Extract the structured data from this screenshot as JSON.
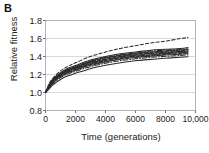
{
  "panel": {
    "label": "B"
  },
  "chart_data": {
    "type": "line",
    "title": "",
    "xlabel": "Time (generations)",
    "ylabel": "Relative fitness",
    "xlim": [
      0,
      10000
    ],
    "ylim": [
      0.8,
      1.8
    ],
    "grid": true,
    "grid_axis": "y",
    "legend": "none",
    "xticks": [
      0,
      2000,
      4000,
      6000,
      8000,
      10000
    ],
    "xtick_labels": [
      "0",
      "2000",
      "4000",
      "6000",
      "8000",
      "10,000"
    ],
    "yticks": [
      0.8,
      1.0,
      1.2,
      1.4,
      1.6,
      1.8
    ],
    "ytick_labels": [
      "0.8",
      "1.0",
      "1.2",
      "1.4",
      "1.6",
      "1.8"
    ],
    "x": [
      0,
      250,
      500,
      1000,
      1500,
      2000,
      3000,
      4000,
      5000,
      6000,
      7000,
      8000,
      9000,
      9500
    ],
    "series": [
      {
        "name": "population-1",
        "style": "dashed",
        "values": [
          1.0,
          1.1,
          1.16,
          1.24,
          1.29,
          1.33,
          1.4,
          1.45,
          1.49,
          1.52,
          1.55,
          1.57,
          1.6,
          1.61
        ]
      },
      {
        "name": "population-2",
        "style": "solid",
        "values": [
          1.0,
          1.09,
          1.15,
          1.22,
          1.27,
          1.3,
          1.36,
          1.4,
          1.43,
          1.45,
          1.47,
          1.48,
          1.49,
          1.5
        ]
      },
      {
        "name": "population-3",
        "style": "dashdot",
        "values": [
          1.0,
          1.08,
          1.14,
          1.21,
          1.26,
          1.29,
          1.35,
          1.39,
          1.42,
          1.44,
          1.46,
          1.47,
          1.48,
          1.485
        ]
      },
      {
        "name": "population-4",
        "style": "solid",
        "values": [
          1.0,
          1.08,
          1.14,
          1.21,
          1.255,
          1.285,
          1.345,
          1.385,
          1.415,
          1.435,
          1.45,
          1.462,
          1.472,
          1.477
        ]
      },
      {
        "name": "population-5",
        "style": "dashed",
        "values": [
          1.0,
          1.075,
          1.135,
          1.205,
          1.25,
          1.28,
          1.34,
          1.378,
          1.408,
          1.428,
          1.443,
          1.455,
          1.465,
          1.47
        ]
      },
      {
        "name": "population-6",
        "style": "solid",
        "values": [
          1.0,
          1.07,
          1.13,
          1.2,
          1.245,
          1.275,
          1.332,
          1.37,
          1.4,
          1.42,
          1.435,
          1.447,
          1.457,
          1.462
        ]
      },
      {
        "name": "population-7",
        "style": "dashdot",
        "values": [
          1.0,
          1.07,
          1.125,
          1.195,
          1.24,
          1.27,
          1.325,
          1.363,
          1.393,
          1.413,
          1.428,
          1.44,
          1.45,
          1.455
        ]
      },
      {
        "name": "population-8",
        "style": "solid",
        "values": [
          1.0,
          1.065,
          1.12,
          1.19,
          1.233,
          1.262,
          1.317,
          1.355,
          1.385,
          1.405,
          1.42,
          1.432,
          1.442,
          1.447
        ]
      },
      {
        "name": "population-9",
        "style": "dashed",
        "values": [
          1.0,
          1.06,
          1.115,
          1.183,
          1.226,
          1.255,
          1.31,
          1.347,
          1.377,
          1.397,
          1.412,
          1.424,
          1.434,
          1.44
        ]
      },
      {
        "name": "population-10",
        "style": "solid",
        "values": [
          1.0,
          1.058,
          1.11,
          1.177,
          1.22,
          1.248,
          1.302,
          1.34,
          1.369,
          1.389,
          1.404,
          1.416,
          1.426,
          1.432
        ]
      },
      {
        "name": "population-11",
        "style": "dashdot",
        "values": [
          1.0,
          1.05,
          1.1,
          1.165,
          1.207,
          1.235,
          1.288,
          1.325,
          1.354,
          1.374,
          1.39,
          1.402,
          1.412,
          1.418
        ]
      },
      {
        "name": "population-12",
        "style": "solid",
        "values": [
          1.0,
          1.04,
          1.085,
          1.145,
          1.185,
          1.213,
          1.265,
          1.302,
          1.331,
          1.352,
          1.368,
          1.381,
          1.392,
          1.398
        ]
      }
    ]
  }
}
